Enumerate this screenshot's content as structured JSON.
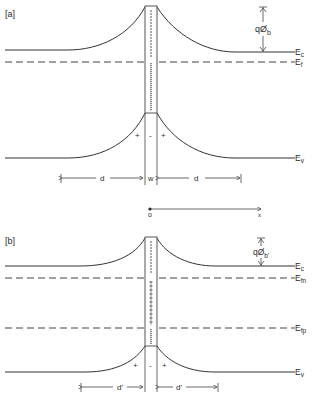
{
  "panels": [
    {
      "id": "a",
      "label": "[a]",
      "levels": {
        "conduction_band": "E",
        "conduction_band_sub": "c",
        "fermi_level": "E",
        "fermi_level_sub": "f",
        "valence_band": "E",
        "valence_band_sub": "v"
      },
      "barrier_label": "qØ",
      "barrier_label_sub": "b",
      "charges": [
        "+",
        "-",
        "+"
      ],
      "dimensions": {
        "left": "d",
        "center": "w",
        "right": "d"
      }
    },
    {
      "id": "b",
      "label": "[b]",
      "levels": {
        "conduction_band": "E",
        "conduction_band_sub": "c",
        "electron_quasi_fermi": "E",
        "electron_quasi_fermi_sub": "fn",
        "hole_quasi_fermi": "E",
        "hole_quasi_fermi_sub": "fp",
        "valence_band": "E",
        "valence_band_sub": "v"
      },
      "barrier_label": "qØ",
      "barrier_label_sub": "b'",
      "charges": [
        "+",
        "-",
        "+"
      ],
      "dimensions": {
        "left": "d'",
        "right": "d'"
      }
    }
  ],
  "axis": {
    "origin_label": "o",
    "axis_label": "x"
  }
}
